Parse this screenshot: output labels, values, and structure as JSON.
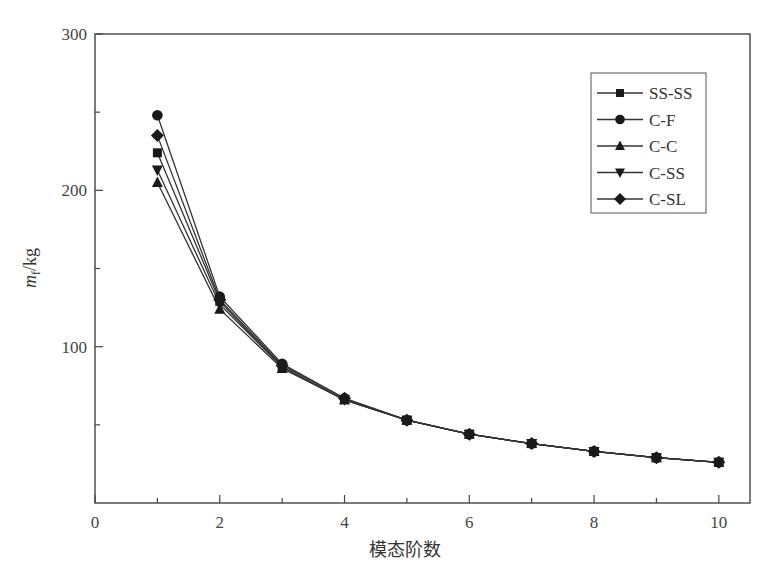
{
  "chart_data": {
    "type": "line",
    "title": "",
    "xlabel": "模态阶数",
    "ylabel": "m_f/kg",
    "ylabel_main": "m",
    "ylabel_sub": "f",
    "ylabel_unit": "/kg",
    "xlim": [
      0,
      10.5
    ],
    "ylim": [
      0,
      300
    ],
    "x_ticks": [
      0,
      2,
      4,
      6,
      8,
      10
    ],
    "y_ticks": [
      100,
      200,
      300
    ],
    "x_tick_labels": [
      "0",
      "2",
      "4",
      "6",
      "8",
      "10"
    ],
    "y_tick_labels": [
      "100",
      "200",
      "300"
    ],
    "grid": false,
    "legend_position": "upper right",
    "x": [
      1,
      2,
      3,
      4,
      5,
      6,
      7,
      8,
      9,
      10
    ],
    "series": [
      {
        "name": "SS-SS",
        "marker": "square",
        "values": [
          224,
          129,
          87,
          66,
          53,
          44,
          38,
          33,
          29,
          26
        ]
      },
      {
        "name": "C-F",
        "marker": "circle",
        "values": [
          248,
          132,
          89,
          67,
          53,
          44,
          38,
          33,
          29,
          26
        ]
      },
      {
        "name": "C-C",
        "marker": "triangle-up",
        "values": [
          205,
          124,
          86,
          66,
          53,
          44,
          38,
          33,
          29,
          26
        ]
      },
      {
        "name": "C-SS",
        "marker": "triangle-down",
        "values": [
          213,
          127,
          87,
          66,
          53,
          44,
          38,
          33,
          29,
          26
        ]
      },
      {
        "name": "C-SL",
        "marker": "diamond",
        "values": [
          235,
          130,
          88,
          67,
          53,
          44,
          38,
          33,
          29,
          26
        ]
      }
    ]
  }
}
